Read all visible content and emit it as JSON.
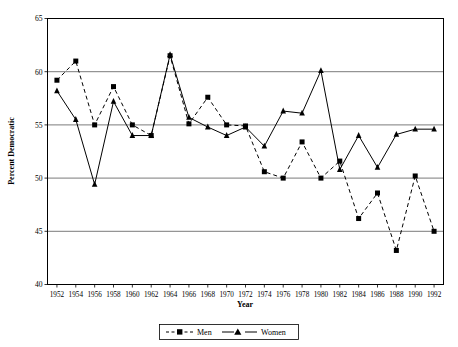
{
  "chart_data": {
    "type": "line",
    "title": "",
    "xlabel": "Year",
    "ylabel": "Percent Democratic",
    "x": [
      1952,
      1954,
      1956,
      1958,
      1960,
      1962,
      1964,
      1966,
      1968,
      1970,
      1972,
      1974,
      1976,
      1978,
      1980,
      1982,
      1984,
      1986,
      1988,
      1990,
      1992
    ],
    "xtick_labels": [
      "1952",
      "1954",
      "1956",
      "1958",
      "1960",
      "1962",
      "1964",
      "1966",
      "1968",
      "1970",
      "1972",
      "1974",
      "1976",
      "1978",
      "1980",
      "1982",
      "1984",
      "1986",
      "1988",
      "1990",
      "1992"
    ],
    "ytick_labels": [
      "40",
      "45",
      "50",
      "55",
      "60",
      "65"
    ],
    "yticks": [
      40,
      45,
      50,
      55,
      60,
      65
    ],
    "ylim": [
      40,
      65
    ],
    "grid": true,
    "legend_position": "bottom",
    "series": [
      {
        "name": "Men",
        "marker": "square",
        "linestyle": "dashed",
        "color": "#000000",
        "values": [
          59.2,
          61.0,
          55.0,
          58.6,
          55.0,
          54.0,
          61.5,
          55.1,
          57.6,
          55.0,
          54.9,
          50.6,
          50.0,
          53.4,
          50.0,
          51.6,
          46.2,
          48.6,
          43.2,
          50.2,
          45.0
        ]
      },
      {
        "name": "Women",
        "marker": "triangle",
        "linestyle": "solid",
        "color": "#000000",
        "values": [
          58.2,
          55.5,
          49.4,
          57.2,
          54.0,
          54.0,
          61.6,
          55.7,
          54.8,
          54.0,
          54.8,
          53.0,
          56.3,
          56.1,
          60.1,
          50.8,
          54.0,
          51.0,
          54.1,
          54.6,
          54.6
        ]
      }
    ]
  },
  "legend": {
    "items": [
      {
        "label": "Men"
      },
      {
        "label": "Women"
      }
    ]
  },
  "axes": {
    "x_title": "Year",
    "y_title": "Percent Democratic"
  }
}
